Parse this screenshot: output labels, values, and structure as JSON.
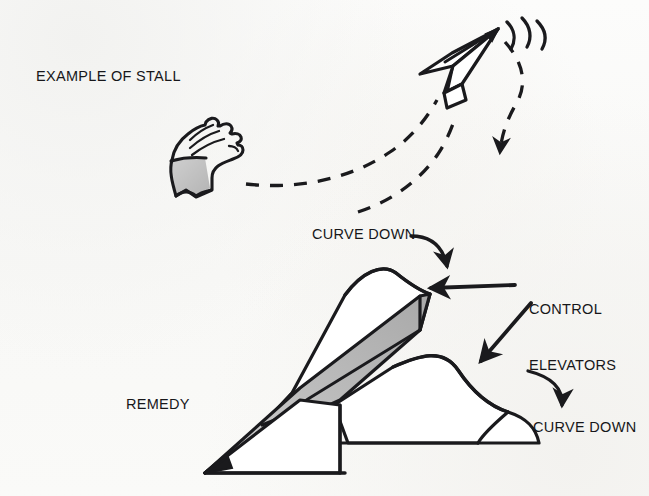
{
  "figure": {
    "background_color": "#fbfbfa",
    "ink_color": "#1a1a1d",
    "shade_color": "#b9b9b9"
  },
  "captions": {
    "example_of_stall": "EXAMPLE OF STALL",
    "curve_down_top": "CURVE DOWN",
    "control_elevators_line1": "CONTROL",
    "control_elevators_line2": "ELEVATORS",
    "remedy": "REMEDY",
    "curve_down_bottom": "CURVE DOWN"
  },
  "top_panel": {
    "name": "example-of-stall-illustration",
    "elements": [
      "throwing-hand",
      "dashed-launch-trajectory",
      "dashed-secondary-trajectory",
      "paper-dart-plane-climbing",
      "stall-motion-arcs",
      "dashed-stall-fall-arrow"
    ]
  },
  "bottom_panel": {
    "name": "remedy-illustration",
    "elements": [
      "large-paper-dart-plane",
      "shaded-keel-body",
      "left-elevator-curved-up",
      "right-elevator-curved-up",
      "curve-down-arrow-top",
      "control-elevators-pointer-left",
      "control-elevators-pointer-right",
      "curve-down-arrow-bottom"
    ]
  }
}
